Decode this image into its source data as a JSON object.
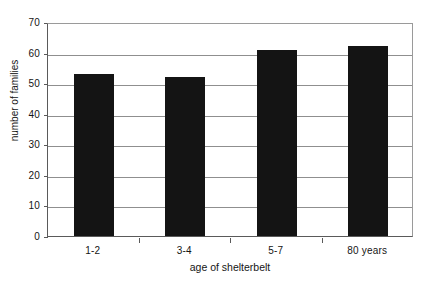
{
  "chart_data": {
    "type": "bar",
    "title": "",
    "subtitle": "",
    "xlabel": "age of shelterbelt",
    "ylabel": "number of families",
    "categories": [
      "1-2",
      "3-4",
      "5-7",
      "80 years"
    ],
    "values": [
      53,
      52,
      61,
      62
    ],
    "series": [
      {
        "name": "number of families",
        "values": [
          53,
          52,
          61,
          62
        ]
      }
    ],
    "ylim": [
      0,
      70
    ],
    "ytick_labels": [
      "0",
      "10",
      "20",
      "30",
      "40",
      "50",
      "60",
      "70"
    ],
    "ytick_values": [
      0,
      10,
      20,
      30,
      40,
      50,
      60,
      70
    ],
    "ytick_step": 10,
    "grid": "horizontal",
    "legend": "none",
    "bar_color": "#141414",
    "gridline_color": "#8f8f8f",
    "axis_color": "#5a5a5a",
    "background_color": "#ffffff",
    "annotations": []
  }
}
